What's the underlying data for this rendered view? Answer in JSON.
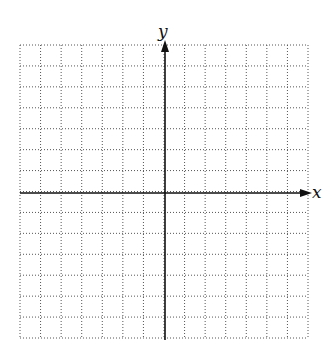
{
  "diagram": {
    "type": "coordinate-grid",
    "x_label": "x",
    "y_label": "y",
    "grid": {
      "columns": 14,
      "rows": 14,
      "left": 20,
      "top": 45,
      "right": 308,
      "bottom": 338,
      "line_style": "dotted",
      "line_color": "#555555"
    },
    "origin": {
      "x": 165,
      "y": 193
    },
    "axis_color": "#111111",
    "x_axis": {
      "from": 20,
      "to": 312,
      "arrow": "right"
    },
    "y_axis": {
      "from": 340,
      "to": 40,
      "arrow": "up"
    }
  }
}
